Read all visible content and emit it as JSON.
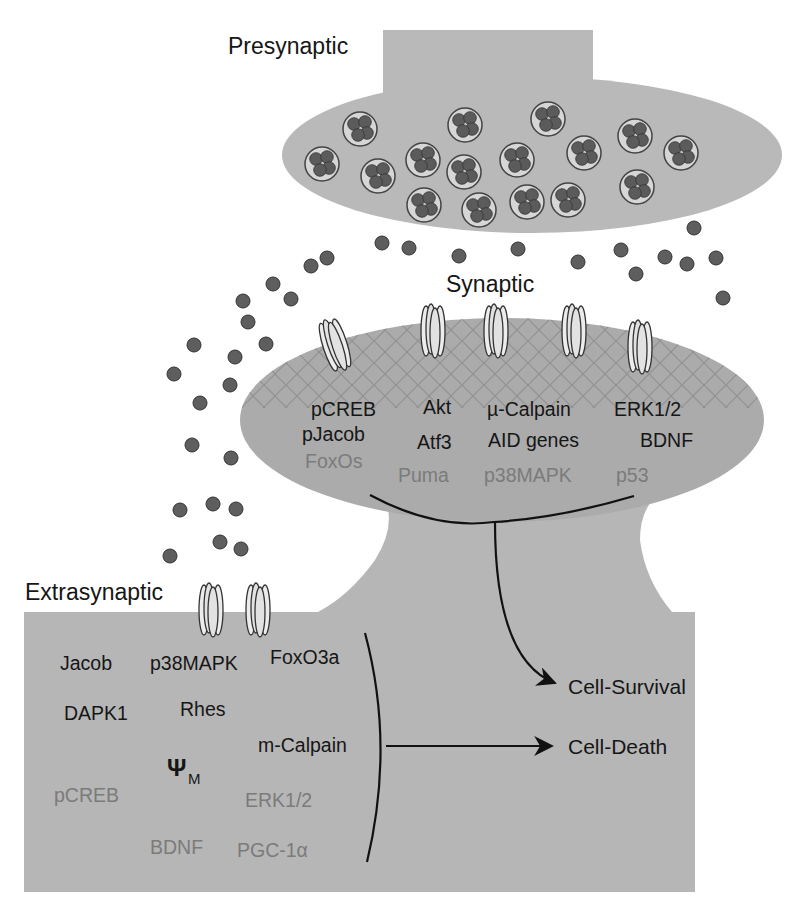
{
  "labels": {
    "presynaptic": "Presynaptic",
    "synaptic": "Synaptic",
    "extrasynaptic": "Extrasynaptic"
  },
  "synaptic_spine": {
    "dark": {
      "pcreb": "pCREB",
      "pjacob": "pJacob",
      "akt": "Akt",
      "atf3": "Atf3",
      "mu_calpain": "µ-Calpain",
      "aid_genes": "AID genes",
      "erk": "ERK1/2",
      "bdnf": "BDNF"
    },
    "gray": {
      "foxos": "FoxOs",
      "puma": "Puma",
      "p38mapk": "p38MAPK",
      "p53": "p53"
    }
  },
  "extrasynaptic_region": {
    "dark": {
      "jacob": "Jacob",
      "p38mapk": "p38MAPK",
      "foxo3a": "FoxO3a",
      "dapk1": "DAPK1",
      "rhes": "Rhes",
      "m_calpain": "m-Calpain",
      "psi": "Ψ",
      "psi_sub": "M"
    },
    "gray": {
      "pcreb": "pCREB",
      "erk": "ERK1/2",
      "bdnf": "BDNF",
      "pgc": "PGC-1α"
    }
  },
  "outcomes": {
    "survival": "Cell-Survival",
    "death": "Cell-Death"
  },
  "colors": {
    "membrane_fill": "#b9b9b9",
    "spine_fill": "#ababab",
    "vesicle_dot": "#555555",
    "receptor_fill": "#e6e6e6",
    "dark_text": "#161616",
    "gray_text": "#7b7b7b"
  }
}
